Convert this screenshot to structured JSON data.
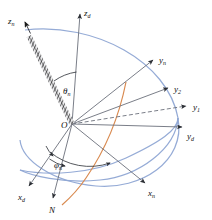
{
  "figure": {
    "background_color": "#ffffff",
    "width": 212,
    "height": 220
  },
  "colors": {
    "axis": "#6b6f7a",
    "axis_dark": "#3a3d44",
    "sphere_curve": "#8fa6d4",
    "meridian_curve": "#d98a50",
    "boom": "#1a1a1a",
    "boom_fill": "#e8e8ea",
    "text": "#111111",
    "dashed_axis": "#6b6f7a"
  },
  "origin": {
    "label": "O",
    "x": 72,
    "y": 124
  },
  "axes": [
    {
      "name": "z-d-axis",
      "label": "z",
      "subscript": "d",
      "label_x": 86,
      "label_y": 14,
      "from": [
        72,
        124
      ],
      "to": [
        80,
        12
      ],
      "style": "solid",
      "arrow": true
    },
    {
      "name": "y-d-axis",
      "label": "y",
      "subscript": "d",
      "label_x": 189,
      "label_y": 138,
      "from": [
        72,
        124
      ],
      "to": [
        186,
        127
      ],
      "style": "solid",
      "arrow": true
    },
    {
      "name": "x-d-axis",
      "label": "x",
      "subscript": "d",
      "label_x": 20,
      "label_y": 199,
      "from": [
        72,
        124
      ],
      "to": [
        27,
        188
      ],
      "style": "solid",
      "arrow": true
    },
    {
      "name": "y-1-axis",
      "label": "y",
      "subscript": "1",
      "label_x": 196,
      "label_y": 113,
      "from": [
        72,
        124
      ],
      "to": [
        190,
        105
      ],
      "style": "dashed",
      "arrow": true
    },
    {
      "name": "y-2-axis",
      "label": "y",
      "subscript": "2",
      "label_x": 177,
      "label_y": 93,
      "from": [
        72,
        124
      ],
      "to": [
        171,
        86
      ],
      "style": "solid",
      "arrow": true
    },
    {
      "name": "y-n-axis",
      "label": "y",
      "subscript": "n",
      "label_x": 162,
      "label_y": 65,
      "from": [
        72,
        124
      ],
      "to": [
        156,
        58
      ],
      "style": "solid",
      "arrow": true
    },
    {
      "name": "x-n-axis",
      "label": "x",
      "subscript": "n",
      "label_x": 152,
      "label_y": 196,
      "from": [
        72,
        124
      ],
      "to": [
        148,
        186
      ],
      "style": "solid",
      "arrow": true
    },
    {
      "name": "z-n-axis",
      "label": "z",
      "subscript": "n",
      "label_x": 10,
      "label_y": 22,
      "from": [
        72,
        124
      ],
      "to": [
        25,
        28
      ],
      "style": "boom",
      "arrow": true
    },
    {
      "name": "node-line-N",
      "label": "N",
      "subscript": "",
      "label_x": 51,
      "label_y": 212,
      "from": [
        72,
        124
      ],
      "to": [
        52,
        200
      ],
      "style": "solid",
      "arrow": true
    }
  ],
  "angles": [
    {
      "name": "theta-angle",
      "label": "θ",
      "subscript": "n",
      "label_x": 66,
      "label_y": 92,
      "description": "angle between z-d axis and z-n boom axis"
    },
    {
      "name": "phi-angle",
      "label": "φ",
      "subscript": "n",
      "label_x": 57,
      "label_y": 166,
      "description": "azimuth angle measured in the x-d y-d plane from x-d toward node line"
    }
  ],
  "curves": [
    {
      "name": "celestial-sphere-outline",
      "color": "#8fa6d4",
      "description": "great-circle ellipse bounding the unit sphere"
    },
    {
      "name": "equator-ellipse",
      "color": "#8fa6d4",
      "description": "tilted equatorial great circle"
    },
    {
      "name": "meridian-arc",
      "color": "#d98a50",
      "description": "orange meridian arc through the node line"
    }
  ],
  "arcs": [
    {
      "name": "phi-arc-inner",
      "description": "small arc marking phi near origin"
    },
    {
      "name": "phi-arc-outer",
      "description": "large arc spanning x-d to node direction"
    },
    {
      "name": "theta-arc",
      "description": "arc between z-d and z-n"
    }
  ]
}
